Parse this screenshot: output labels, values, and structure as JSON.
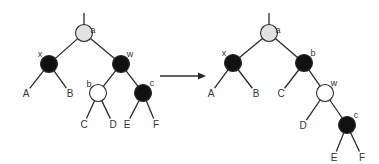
{
  "diagram": {
    "colors": {
      "root": "#e2e2e2",
      "black": "#111111",
      "white": "#ffffff",
      "stroke": "#2a2a2a"
    },
    "before": {
      "nodes": [
        {
          "id": "a",
          "label": "a",
          "color": "root"
        },
        {
          "id": "x",
          "label": "x",
          "color": "black"
        },
        {
          "id": "w",
          "label": "w",
          "color": "black"
        },
        {
          "id": "b",
          "label": "b",
          "color": "white"
        },
        {
          "id": "c",
          "label": "c",
          "color": "black"
        }
      ],
      "leaves": [
        "A",
        "B",
        "C",
        "D",
        "E",
        "F"
      ],
      "edges": [
        [
          "a",
          "x"
        ],
        [
          "a",
          "w"
        ],
        [
          "x",
          "A"
        ],
        [
          "x",
          "B"
        ],
        [
          "w",
          "b"
        ],
        [
          "w",
          "c"
        ],
        [
          "b",
          "C"
        ],
        [
          "b",
          "D"
        ],
        [
          "c",
          "E"
        ],
        [
          "c",
          "F"
        ]
      ]
    },
    "after": {
      "nodes": [
        {
          "id": "a",
          "label": "a",
          "color": "root"
        },
        {
          "id": "x",
          "label": "x",
          "color": "black"
        },
        {
          "id": "b",
          "label": "b",
          "color": "black"
        },
        {
          "id": "w",
          "label": "w",
          "color": "white"
        },
        {
          "id": "c",
          "label": "c",
          "color": "black"
        }
      ],
      "leaves": [
        "A",
        "B",
        "C",
        "D",
        "E",
        "F"
      ],
      "edges": [
        [
          "a",
          "x"
        ],
        [
          "a",
          "b"
        ],
        [
          "x",
          "A"
        ],
        [
          "x",
          "B"
        ],
        [
          "b",
          "C"
        ],
        [
          "b",
          "w"
        ],
        [
          "w",
          "D"
        ],
        [
          "w",
          "c"
        ],
        [
          "c",
          "E"
        ],
        [
          "c",
          "F"
        ]
      ]
    },
    "arrow": "transforms-to"
  }
}
